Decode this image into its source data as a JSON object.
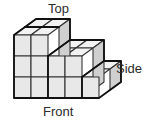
{
  "figure": {
    "kind": "isometric-cube-stack",
    "title": "",
    "cube_count_visible_columns": [
      3,
      3,
      2,
      2,
      1
    ],
    "depth_in_cubes": 2,
    "max_height_in_cubes": 3,
    "colors": {
      "top_face": "#f2f2f2",
      "front_face": "#e8e8e8",
      "side_face": "#d0d0d0",
      "outline": "#1a1a1a",
      "inner_line": "#333333",
      "label_text": "#2b2b2b",
      "background": "#ffffff"
    },
    "labels": {
      "top": "Top",
      "side": "Side",
      "front": "Front"
    },
    "geometry": {
      "unit_width": 17,
      "unit_height": 21,
      "depth_dx": 11,
      "depth_dy": -8,
      "origin_x": 14,
      "origin_y": 98
    }
  }
}
